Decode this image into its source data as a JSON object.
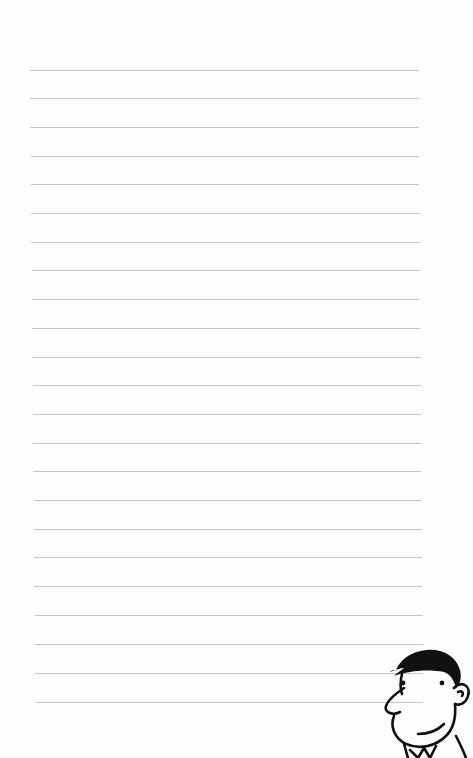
{
  "page": {
    "type": "lined-notebook-page",
    "background_color": "#fefefe",
    "line_color": "#c4c4c4",
    "line_count": 23,
    "lines": [
      {
        "y": 70,
        "x1": 30,
        "x2": 419
      },
      {
        "y": 98,
        "x1": 30,
        "x2": 419
      },
      {
        "y": 127,
        "x1": 30,
        "x2": 419
      },
      {
        "y": 156,
        "x1": 31,
        "x2": 419
      },
      {
        "y": 184,
        "x1": 31,
        "x2": 419
      },
      {
        "y": 213,
        "x1": 31,
        "x2": 420
      },
      {
        "y": 242,
        "x1": 31,
        "x2": 420
      },
      {
        "y": 270,
        "x1": 32,
        "x2": 420
      },
      {
        "y": 299,
        "x1": 32,
        "x2": 420
      },
      {
        "y": 328,
        "x1": 32,
        "x2": 420
      },
      {
        "y": 357,
        "x1": 32,
        "x2": 421
      },
      {
        "y": 385,
        "x1": 33,
        "x2": 421
      },
      {
        "y": 414,
        "x1": 33,
        "x2": 421
      },
      {
        "y": 443,
        "x1": 33,
        "x2": 421
      },
      {
        "y": 471,
        "x1": 33,
        "x2": 421
      },
      {
        "y": 500,
        "x1": 34,
        "x2": 422
      },
      {
        "y": 529,
        "x1": 34,
        "x2": 422
      },
      {
        "y": 557,
        "x1": 34,
        "x2": 422
      },
      {
        "y": 586,
        "x1": 34,
        "x2": 422
      },
      {
        "y": 615,
        "x1": 35,
        "x2": 423
      },
      {
        "y": 644,
        "x1": 35,
        "x2": 423
      },
      {
        "y": 673,
        "x1": 35,
        "x2": 423
      },
      {
        "y": 702,
        "x1": 36,
        "x2": 423
      }
    ]
  },
  "illustration": {
    "subject": "cartoon-man-face",
    "position": "bottom-right",
    "stroke_color": "#111111"
  }
}
